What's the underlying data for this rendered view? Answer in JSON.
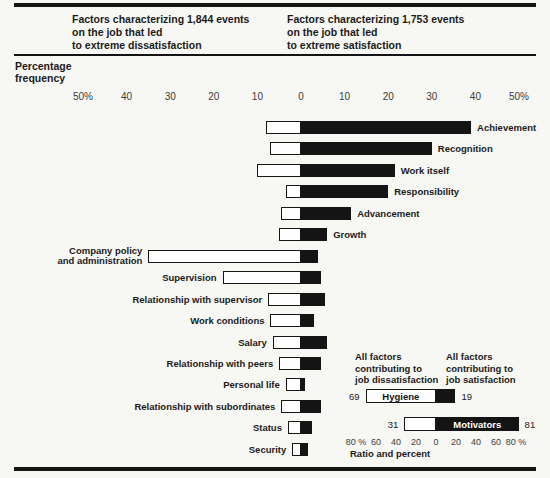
{
  "figure": {
    "left_header_lines": [
      "Factors characterizing 1,844 events",
      "on the job that led",
      "to extreme dissatisfaction"
    ],
    "right_header_lines": [
      "Factors characterizing 1,753 events",
      "on the job that led",
      "to extreme satisfaction"
    ],
    "axis_title_lines": [
      "Percentage",
      "frequency"
    ],
    "colors": {
      "bar_black": "#141414",
      "bar_white": "#fefefe",
      "page_bg": "#f7f7f4",
      "rule": "#141414"
    }
  },
  "chart_data": {
    "type": "bar",
    "orientation": "horizontal-diverging",
    "title_left": "Factors characterizing 1,844 events on the job that led to extreme dissatisfaction",
    "title_right": "Factors characterizing 1,753 events on the job that led to extreme satisfaction",
    "xlabel": "Percentage frequency",
    "x_ticks": [
      "50%",
      "40",
      "30",
      "20",
      "10",
      "0",
      "10",
      "20",
      "30",
      "40",
      "50%"
    ],
    "xlim": [
      -50,
      50
    ],
    "categories": [
      "Achievement",
      "Recognition",
      "Work itself",
      "Responsibility",
      "Advancement",
      "Growth",
      "Company policy and administration",
      "Supervision",
      "Relationship with supervisor",
      "Work conditions",
      "Salary",
      "Relationship with peers",
      "Personal life",
      "Relationship with subordinates",
      "Status",
      "Security"
    ],
    "series": [
      {
        "name": "Percentage frequency leading to extreme dissatisfaction (white, left)",
        "values": [
          8,
          7,
          10,
          3.5,
          4.5,
          5,
          35,
          18,
          7.5,
          7,
          6.5,
          5,
          3.5,
          4.5,
          3,
          2
        ]
      },
      {
        "name": "Percentage frequency leading to extreme satisfaction (black, right)",
        "values": [
          39,
          30,
          21.5,
          20,
          11.5,
          6,
          4,
          4.5,
          5.5,
          3,
          6,
          4.5,
          1,
          4.5,
          2.5,
          1.5
        ]
      }
    ],
    "label_side": [
      "right",
      "right",
      "right",
      "right",
      "right",
      "right",
      "left",
      "left",
      "left",
      "left",
      "left",
      "left",
      "left",
      "left",
      "left",
      "left"
    ],
    "category_label_lines": {
      "Company policy and administration": [
        "Company policy",
        "and administration"
      ]
    },
    "legend_position": "none",
    "grid": false,
    "inset": {
      "type": "bar",
      "title_left_lines": [
        "All factors",
        "contributing to",
        "job dissatisfaction"
      ],
      "title_right_lines": [
        "All factors",
        "contributing to",
        "job satisfaction"
      ],
      "rows": [
        {
          "label": "Hygiene",
          "left_pct": 69,
          "right_pct": 19,
          "left_value": "69",
          "right_value": "19",
          "label_on": "white"
        },
        {
          "label": "Motivators",
          "left_pct": 31,
          "right_pct": 81,
          "left_value": "31",
          "right_value": "81",
          "label_on": "black"
        }
      ],
      "x_ticks": [
        "80 %",
        "60",
        "40",
        "20",
        "0",
        "20",
        "40",
        "60",
        "80 %"
      ],
      "caption": "Ratio and percent"
    }
  }
}
